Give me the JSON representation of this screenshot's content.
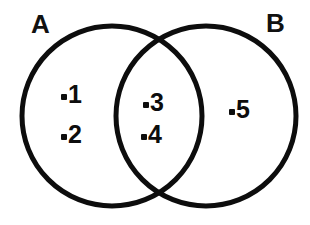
{
  "figure": {
    "type": "venn-diagram",
    "title": "",
    "background_color": "#ffffff",
    "stroke_color": "#0d0d0d",
    "text_color": "#0d0d0d",
    "stroke_width": 5
  },
  "sets": [
    {
      "id": "A",
      "label": "A",
      "center_x": 112,
      "center_y": 116,
      "radius": 90
    },
    {
      "id": "B",
      "label": "B",
      "center_x": 206,
      "center_y": 116,
      "radius": 90
    }
  ],
  "elements": [
    {
      "value": "1",
      "dot": "•",
      "region": "A-only"
    },
    {
      "value": "2",
      "dot": "•",
      "region": "A-only"
    },
    {
      "value": "3",
      "dot": "•",
      "region": "A-and-B"
    },
    {
      "value": "4",
      "dot": "•",
      "region": "A-and-B"
    },
    {
      "value": "5",
      "dot": "•",
      "region": "B-only"
    }
  ],
  "chart_data": {
    "type": "venn",
    "title": "",
    "xlabel": "",
    "ylabel": "",
    "set_labels": [
      "A",
      "B"
    ],
    "regions": [
      {
        "name": "A only",
        "members": [
          "1",
          "2"
        ],
        "count": 2
      },
      {
        "name": "A ∩ B",
        "members": [
          "3",
          "4"
        ],
        "count": 2
      },
      {
        "name": "B only",
        "members": [
          "5"
        ],
        "count": 1
      }
    ],
    "set_totals": [
      {
        "set": "A",
        "members": [
          "1",
          "2",
          "3",
          "4"
        ],
        "count": 4
      },
      {
        "set": "B",
        "members": [
          "3",
          "4",
          "5"
        ],
        "count": 3
      }
    ],
    "universe_count": 5,
    "grid": false,
    "legend": "none"
  }
}
